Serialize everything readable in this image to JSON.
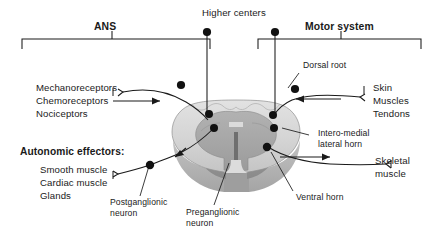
{
  "figure": {
    "background": "#ffffff",
    "line_color": "#1a1a1a",
    "grey_matter_color": "#a9a9a9",
    "white_matter_color": "#d6d6d6",
    "white_matter_shadow": "#b9b9b9"
  },
  "brackets": {
    "ans": {
      "label": "ANS"
    },
    "motor": {
      "label": "Motor system"
    }
  },
  "top": {
    "higher_centers": "Higher centers"
  },
  "left_column": {
    "receptors": [
      "Mechanoreceptors",
      "Chemoreceptors",
      "Nociceptors"
    ],
    "effectors_title": "Autonomic effectors:",
    "effectors": [
      "Smooth muscle",
      "Cardiac muscle",
      "Glands"
    ]
  },
  "right_column": {
    "sensory_targets": [
      "Skin",
      "Muscles",
      "Tendons"
    ],
    "skeletal_muscle_line1": "Skeletal",
    "skeletal_muscle_line2": "muscle"
  },
  "callouts": {
    "dorsal_root": "Dorsal root",
    "intero_medial_line1": "Intero-medial",
    "intero_medial_line2": "lateral horn",
    "ventral_horn": "Ventral horn",
    "postganglionic_line1": "Postganglionic",
    "postganglionic_line2": "neuron",
    "preganglionic_line1": "Preganglionic",
    "preganglionic_line2": "neuron"
  }
}
